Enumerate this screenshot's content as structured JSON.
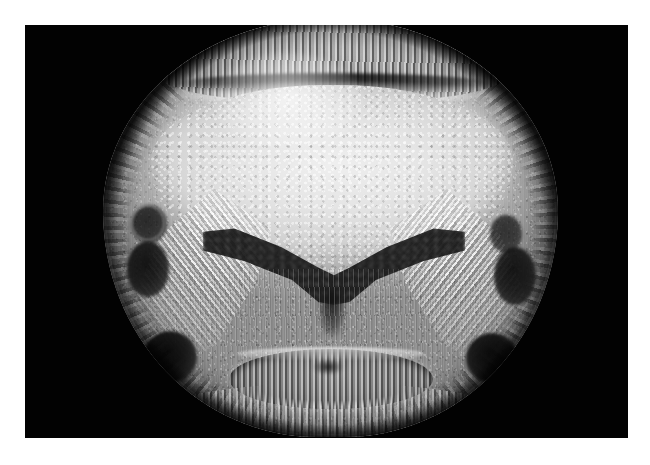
{
  "figure": {
    "kind": "grayscale-cross-section-micrograph",
    "title": "Transverse cross-section micrograph",
    "background_color": "#ffffff",
    "plate_color": "#020202",
    "color_mode": "grayscale",
    "has_scale_bar": false,
    "has_labels": false,
    "has_axes": false,
    "has_caption": false,
    "plate": {
      "name": "black-image-plate",
      "x": 25,
      "y": 25,
      "width": 603,
      "height": 413
    },
    "specimen": {
      "name": "specimen-cross-section",
      "outline_shape": "rounded-oval",
      "x": 78,
      "y": -6,
      "width": 455,
      "height": 418,
      "symmetry": "bilateral-vertical"
    },
    "regions": [
      {
        "id": "rind-cap",
        "label": "Top rind cap / textured outer layer",
        "tone": "mid-grey-striated"
      },
      {
        "id": "rind-dark-arc",
        "label": "Dark arc beneath rind cap",
        "tone": "near-black"
      },
      {
        "id": "cortex-ring",
        "label": "Outer cortex ring",
        "tone": "bright-striated"
      },
      {
        "id": "central-core",
        "label": "Central bright core",
        "tone": "light-grey-speckled"
      },
      {
        "id": "dark-cavity",
        "label": "Dark butterfly / V-shaped cavity",
        "tone": "near-black"
      },
      {
        "id": "wing-left",
        "label": "Left bright fibrous wing",
        "tone": "white-fibrous"
      },
      {
        "id": "wing-right",
        "label": "Right bright fibrous wing",
        "tone": "white-fibrous"
      },
      {
        "id": "lower-organ",
        "label": "Lower elliptical striated organ",
        "tone": "mid-dark-striated"
      },
      {
        "id": "bottom-rind",
        "label": "Bottom bright rind band",
        "tone": "white-striated"
      }
    ],
    "dark_bundles": [
      {
        "id": "bundle-l1",
        "side": "left",
        "position": "upper",
        "shape": "ring"
      },
      {
        "id": "bundle-l2",
        "side": "left",
        "position": "middle",
        "shape": "oval"
      },
      {
        "id": "bundle-l3",
        "side": "left",
        "position": "lower",
        "shape": "circle"
      },
      {
        "id": "bundle-r1",
        "side": "right",
        "position": "upper",
        "shape": "oval"
      },
      {
        "id": "bundle-r2",
        "side": "right",
        "position": "middle",
        "shape": "oval"
      },
      {
        "id": "bundle-r3",
        "side": "right",
        "position": "lower",
        "shape": "circle"
      }
    ],
    "palette": {
      "background": "#ffffff",
      "plate": "#020202",
      "core_light": "#ebebeb",
      "tissue_mid": "#a9a9a9",
      "tissue_dark": "#6e6e6e",
      "cavity": "#1b1b1b",
      "highlight": "#ffffff"
    }
  }
}
